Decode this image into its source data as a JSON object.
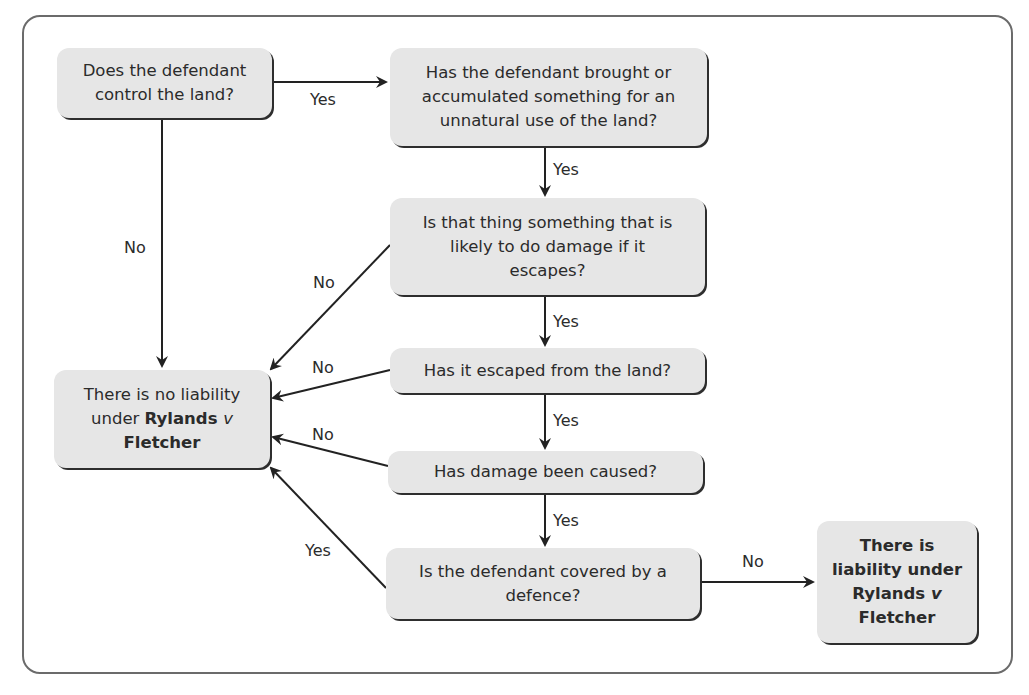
{
  "diagram": {
    "nodes": {
      "control": {
        "text": "Does the defendant control the land?"
      },
      "accumulated": {
        "text": "Has the defendant brought or accumulated something for an unnatural use of the land?"
      },
      "likely_damage": {
        "text": "Is that thing something that is likely to do damage if it escapes?"
      },
      "escaped": {
        "text": "Has it escaped from the land?"
      },
      "damage": {
        "text": "Has damage been caused?"
      },
      "defence": {
        "text": "Is the defendant covered by a defence?"
      },
      "no_liability": {
        "pre": "There is no liability under ",
        "case_a": "Rylands ",
        "case_v": "v",
        "case_b": "Fletcher"
      },
      "liability": {
        "pre": "There is liability under ",
        "case_a": "Rylands ",
        "case_v": "v",
        "case_b": "Fletcher"
      }
    },
    "edges": {
      "control_to_accumulated": "Yes",
      "control_to_no_liability": "No",
      "accumulated_to_likely": "Yes",
      "likely_to_no_liability": "No",
      "likely_to_escaped": "Yes",
      "escaped_to_no_liability": "No",
      "escaped_to_damage": "Yes",
      "damage_to_no_liability": "No",
      "damage_to_defence": "Yes",
      "defence_to_no_liability": "Yes",
      "defence_to_liability": "No"
    }
  }
}
